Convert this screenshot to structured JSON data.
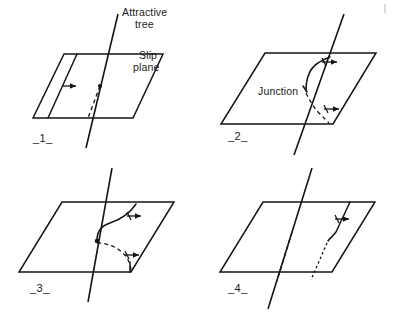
{
  "figure": {
    "caption_present": false,
    "background_color": "#ffffff",
    "ink_color": "#141414",
    "width": 396,
    "height": 315
  },
  "annotations": {
    "attractive_tree_line1": "Attractive",
    "attractive_tree_line2": "tree",
    "slip_plane_line1": "Slip",
    "slip_plane_line2": "plane",
    "junction": "Junction"
  },
  "panels": [
    {
      "id": "panel-1",
      "number_label": "_1_",
      "description": "Straight dislocation line on slip plane approaching attractive tree",
      "elements": {
        "has_plane": true,
        "has_tree": true,
        "has_node_dot": true,
        "dislocation_style": "straight-solid-above-dashed-below",
        "arrow_count": 1
      }
    },
    {
      "id": "panel-2",
      "number_label": "_2_",
      "description": "Dislocation bends at attractive tree and a junction forms",
      "elements": {
        "has_plane": true,
        "has_tree": true,
        "has_node_dot": false,
        "dislocation_style": "curved-solid-upper-dashed-arc-lower",
        "arrow_count": 2,
        "junction_label": true
      }
    },
    {
      "id": "panel-3",
      "number_label": "_3_",
      "description": "Junction grows; arms bow out on both sides of the tree",
      "elements": {
        "has_plane": true,
        "has_tree": true,
        "has_node_dot": true,
        "dislocation_style": "bowed-solid-upper-dashed-arc-lower",
        "arrow_count": 2
      }
    },
    {
      "id": "panel-4",
      "number_label": "_4_",
      "description": "Dislocation has passed the tree leaving a kinked line",
      "elements": {
        "has_plane": true,
        "has_tree": true,
        "has_node_dot": false,
        "dislocation_style": "kinked-solid-upper-dotted-lower",
        "arrow_count": 1
      }
    }
  ]
}
